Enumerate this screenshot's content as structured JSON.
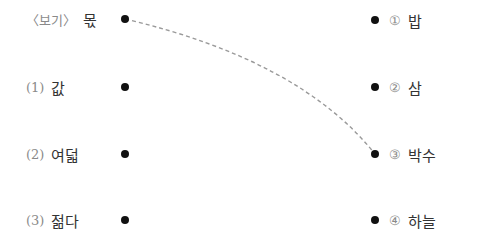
{
  "exercise": {
    "left_items": [
      {
        "prefix": "〈보기〉",
        "word": "몫",
        "y": 19
      },
      {
        "prefix": "(1)",
        "word": "값",
        "y": 87
      },
      {
        "prefix": "(2)",
        "word": "여덟",
        "y": 154
      },
      {
        "prefix": "(3)",
        "word": "젊다",
        "y": 220
      }
    ],
    "right_items": [
      {
        "prefix": "①",
        "word": "밥",
        "y": 20
      },
      {
        "prefix": "②",
        "word": "삼",
        "y": 87
      },
      {
        "prefix": "③",
        "word": "박수",
        "y": 154
      },
      {
        "prefix": "④",
        "word": "하늘",
        "y": 220
      }
    ],
    "left_dot_x": 125,
    "right_dot_x": 375,
    "example_connection": {
      "from": "몫",
      "to": "③ 박수",
      "style": "dashed",
      "color": "#9a9a9a"
    }
  }
}
